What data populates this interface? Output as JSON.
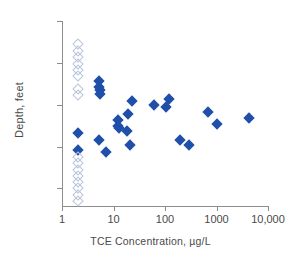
{
  "chart_data": {
    "type": "scatter",
    "title": "",
    "xlabel": "TCE Concentration, µg/L",
    "ylabel": "Depth, feet",
    "xscale": "log",
    "xlim": [
      1,
      10000
    ],
    "ylim": [
      0,
      43
    ],
    "y_inverted": true,
    "grid": false,
    "legend": "none",
    "xticks": [
      1,
      10,
      100,
      1000,
      10000
    ],
    "xtick_labels": [
      "1",
      "10",
      "100",
      "1000",
      "10,000"
    ],
    "yticks": [
      0,
      10,
      20,
      30,
      40
    ],
    "ytick_labels": [
      "0",
      "10",
      "20",
      "30",
      "40"
    ],
    "series": [
      {
        "name": "detected",
        "marker": "filled-diamond",
        "color": "#1f4fa8",
        "points": [
          {
            "x": 2.0,
            "y": 26.8
          },
          {
            "x": 2.0,
            "y": 30.9
          },
          {
            "x": 5.2,
            "y": 14.4
          },
          {
            "x": 5.2,
            "y": 15.7
          },
          {
            "x": 5.4,
            "y": 16.5
          },
          {
            "x": 5.4,
            "y": 17.4
          },
          {
            "x": 5.2,
            "y": 28.4
          },
          {
            "x": 7.2,
            "y": 31.3
          },
          {
            "x": 12.0,
            "y": 23.6
          },
          {
            "x": 12.5,
            "y": 25.1
          },
          {
            "x": 13.0,
            "y": 25.6
          },
          {
            "x": 18.0,
            "y": 26.3
          },
          {
            "x": 19.0,
            "y": 22.2
          },
          {
            "x": 21.0,
            "y": 29.7
          },
          {
            "x": 23.0,
            "y": 19.2
          },
          {
            "x": 62.0,
            "y": 20.0
          },
          {
            "x": 105.0,
            "y": 20.5
          },
          {
            "x": 120.0,
            "y": 18.6
          },
          {
            "x": 195.0,
            "y": 28.4
          },
          {
            "x": 290.0,
            "y": 29.7
          },
          {
            "x": 680.0,
            "y": 21.8
          },
          {
            "x": 1000.0,
            "y": 24.7
          },
          {
            "x": 4300.0,
            "y": 23.2
          }
        ]
      },
      {
        "name": "non-detect (plotted at detection limit)",
        "marker": "open-diamond",
        "color": "#b9c4dc",
        "points": [
          {
            "x": 2.0,
            "y": 5.4
          },
          {
            "x": 2.0,
            "y": 7.2
          },
          {
            "x": 2.0,
            "y": 8.7
          },
          {
            "x": 2.0,
            "y": 10.2
          },
          {
            "x": 2.0,
            "y": 11.7
          },
          {
            "x": 2.0,
            "y": 13.2
          },
          {
            "x": 2.0,
            "y": 16.3
          },
          {
            "x": 2.0,
            "y": 17.6
          },
          {
            "x": 2.0,
            "y": 32.5
          },
          {
            "x": 2.0,
            "y": 34.0
          },
          {
            "x": 2.0,
            "y": 35.5
          },
          {
            "x": 2.0,
            "y": 37.0
          },
          {
            "x": 2.0,
            "y": 38.5
          },
          {
            "x": 2.0,
            "y": 40.0
          },
          {
            "x": 2.0,
            "y": 41.5
          },
          {
            "x": 2.0,
            "y": 43.0
          }
        ]
      }
    ]
  }
}
